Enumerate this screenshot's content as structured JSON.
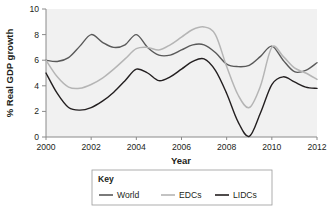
{
  "chart_data": {
    "type": "line",
    "title": "",
    "xlabel": "Year",
    "ylabel": "% Real GDP growth",
    "xlim": [
      2000,
      2012
    ],
    "ylim": [
      0,
      10
    ],
    "grid": false,
    "legend_position": "bottom",
    "legend_title": "Key",
    "xticks": [
      "2000",
      "2002",
      "2004",
      "2006",
      "2008",
      "2010",
      "2012"
    ],
    "xtick_values": [
      2000,
      2002,
      2004,
      2006,
      2008,
      2010,
      2012
    ],
    "yticks": [
      "0",
      "2",
      "4",
      "6",
      "8",
      "10"
    ],
    "ytick_values": [
      0,
      2,
      4,
      6,
      8,
      10
    ],
    "x": [
      2000,
      2000.5,
      2001,
      2001.5,
      2002,
      2002.5,
      2003,
      2003.5,
      2004,
      2004.5,
      2005,
      2005.5,
      2006,
      2006.5,
      2007,
      2007.5,
      2008,
      2008.5,
      2009,
      2009.5,
      2010,
      2010.5,
      2011,
      2011.5,
      2012
    ],
    "series": [
      {
        "name": "World",
        "color": "#595959",
        "values": [
          6.0,
          5.9,
          6.2,
          7.1,
          8.0,
          7.4,
          7.0,
          7.2,
          8.0,
          7.0,
          6.4,
          6.4,
          6.8,
          7.2,
          7.2,
          6.6,
          5.7,
          5.5,
          5.6,
          6.3,
          7.1,
          6.0,
          5.1,
          5.2,
          5.8
        ]
      },
      {
        "name": "EDCs",
        "color": "#b5b5b5",
        "values": [
          6.0,
          4.7,
          3.9,
          3.8,
          4.1,
          4.6,
          5.3,
          6.1,
          6.9,
          7.0,
          6.8,
          7.2,
          7.8,
          8.4,
          8.6,
          8.0,
          5.5,
          3.3,
          2.3,
          4.0,
          7.0,
          6.3,
          5.4,
          5.0,
          4.5
        ]
      },
      {
        "name": "LIDCs",
        "color": "#231f20",
        "values": [
          5.0,
          3.4,
          2.3,
          2.1,
          2.3,
          2.8,
          3.5,
          4.4,
          5.3,
          5.0,
          4.4,
          4.7,
          5.3,
          5.9,
          6.1,
          5.2,
          3.4,
          1.2,
          0.05,
          1.9,
          4.1,
          4.7,
          4.3,
          3.9,
          3.8
        ]
      }
    ]
  },
  "axes": {
    "ylabel": "% Real GDP growth",
    "xlabel": "Year"
  },
  "legend": {
    "title": "Key",
    "items": [
      {
        "label": "World",
        "color": "#595959"
      },
      {
        "label": "EDCs",
        "color": "#b5b5b5"
      },
      {
        "label": "LIDCs",
        "color": "#231f20"
      }
    ]
  }
}
